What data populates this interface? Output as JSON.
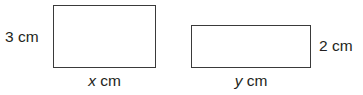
{
  "figure": {
    "background_color": "#ffffff",
    "stroke_color": "#3a3a3a",
    "text_color": "#231f20",
    "shapes": [
      {
        "name": "rectangle-a",
        "type": "rectangle",
        "height_label": "3 cm",
        "width_label_variable": "x",
        "width_label_unit": " cm"
      },
      {
        "name": "rectangle-b",
        "type": "rectangle",
        "height_label": "2 cm",
        "width_label_variable": "y",
        "width_label_unit": " cm"
      }
    ],
    "labels": {
      "rect_a_height": "3 cm",
      "rect_a_width_var": "x",
      "rect_a_width_unit": " cm",
      "rect_b_height": "2 cm",
      "rect_b_width_var": "y",
      "rect_b_width_unit": " cm"
    }
  }
}
